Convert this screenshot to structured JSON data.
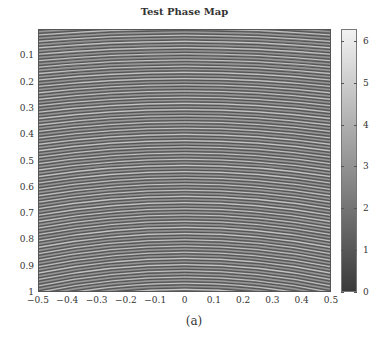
{
  "chart_data": {
    "type": "heatmap",
    "title": "Test Phase Map",
    "xlabel": "",
    "ylabel": "",
    "x_ticks": [
      "-0.5",
      "-0.4",
      "-0.3",
      "-0.2",
      "-0.1",
      "0",
      "0.1",
      "0.2",
      "0.3",
      "0.4",
      "0.5"
    ],
    "y_ticks": [
      "0.1",
      "0.2",
      "0.3",
      "0.4",
      "0.5",
      "0.6",
      "0.7",
      "0.8",
      "0.9",
      "1"
    ],
    "xlim": [
      -0.5,
      0.5
    ],
    "ylim": [
      0,
      1
    ],
    "y_axis_direction": "reversed (0 at top, 1 at bottom)",
    "colormap": "gray",
    "colorbar": {
      "range": [
        0,
        6.283
      ],
      "ticks": [
        "0",
        "1",
        "2",
        "3",
        "4",
        "5",
        "6"
      ]
    },
    "pattern": "dense near-horizontal wrapped-phase fringes, slightly curved (arcs), approx 85 fringes across y-range",
    "caption": "(a)"
  },
  "footer_text_partial": "Test Fringe Pattern"
}
